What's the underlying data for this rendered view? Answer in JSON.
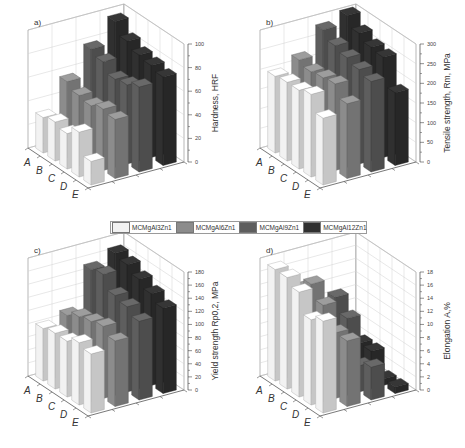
{
  "legend": [
    {
      "label": "MCMgAl3Zn1",
      "color": "#f2f2f2"
    },
    {
      "label": "MCMgAl6Zn1",
      "color": "#8c8c8c"
    },
    {
      "label": "MCMgAl9Zn1",
      "color": "#5e5e5e"
    },
    {
      "label": "MCMgAl12Zn1",
      "color": "#303030"
    }
  ],
  "chart_data": [
    {
      "type": "bar",
      "panel": "a)",
      "title": "a)",
      "categories": [
        "A",
        "B",
        "C",
        "D",
        "E"
      ],
      "ylabel": "Hardness, HRF",
      "ylim": [
        0,
        100
      ],
      "yticks": [
        0,
        20,
        40,
        60,
        80,
        100
      ],
      "series": [
        {
          "name": "MCMgAl3Zn1",
          "values": [
            30,
            33,
            30,
            38,
            20
          ]
        },
        {
          "name": "MCMgAl6Zn1",
          "values": [
            55,
            50,
            48,
            52,
            50
          ]
        },
        {
          "name": "MCMgAl9Zn1",
          "values": [
            77,
            73,
            65,
            67,
            72
          ]
        },
        {
          "name": "MCMgAl12Zn1",
          "values": [
            95,
            85,
            80,
            78,
            75
          ]
        }
      ]
    },
    {
      "type": "bar",
      "panel": "b)",
      "title": "b)",
      "categories": [
        "A",
        "B",
        "C",
        "D",
        "E"
      ],
      "ylabel": "Tensile strength, Rm, MPa",
      "ylim": [
        0,
        300
      ],
      "yticks": [
        0,
        50,
        100,
        150,
        200,
        250,
        300
      ],
      "series": [
        {
          "name": "MCMgAl3Zn1",
          "values": [
            195,
            200,
            200,
            210,
            170
          ]
        },
        {
          "name": "MCMgAl6Zn1",
          "values": [
            220,
            210,
            215,
            220,
            190
          ]
        },
        {
          "name": "MCMgAl9Zn1",
          "values": [
            280,
            260,
            250,
            240,
            230
          ]
        },
        {
          "name": "MCMgAl12Zn1",
          "values": [
            300,
            275,
            260,
            255,
            185
          ]
        }
      ]
    },
    {
      "type": "bar",
      "panel": "c)",
      "title": "c)",
      "categories": [
        "A",
        "B",
        "C",
        "D",
        "E"
      ],
      "ylabel": "Yield strength Rp0,2, MPa",
      "ylim": [
        0,
        180
      ],
      "yticks": [
        0,
        20,
        40,
        60,
        80,
        100,
        120,
        140,
        160,
        180
      ],
      "series": [
        {
          "name": "MCMgAl3Zn1",
          "values": [
            80,
            85,
            85,
            95,
            90
          ]
        },
        {
          "name": "MCMgAl6Zn1",
          "values": [
            90,
            100,
            105,
            110,
            100
          ]
        },
        {
          "name": "MCMgAl9Zn1",
          "values": [
            150,
            155,
            135,
            130,
            120
          ]
        },
        {
          "name": "MCMgAl12Zn1",
          "values": [
            165,
            160,
            150,
            140,
            130
          ]
        }
      ]
    },
    {
      "type": "bar",
      "panel": "d)",
      "title": "d)",
      "categories": [
        "A",
        "B",
        "C",
        "D",
        "E"
      ],
      "ylabel": "Elongation A,%",
      "ylim": [
        0,
        18
      ],
      "yticks": [
        0,
        2,
        4,
        6,
        8,
        10,
        12,
        14,
        16,
        18
      ],
      "series": [
        {
          "name": "MCMgAl3Zn1",
          "values": [
            17,
            17,
            16,
            13,
            14
          ]
        },
        {
          "name": "MCMgAl6Zn1",
          "values": [
            13,
            15,
            13,
            10,
            10
          ]
        },
        {
          "name": "MCMgAl9Zn1",
          "values": [
            5,
            12,
            10,
            4,
            5
          ]
        },
        {
          "name": "MCMgAl12Zn1",
          "values": [
            2.5,
            4,
            4,
            1,
            1
          ]
        }
      ]
    }
  ]
}
